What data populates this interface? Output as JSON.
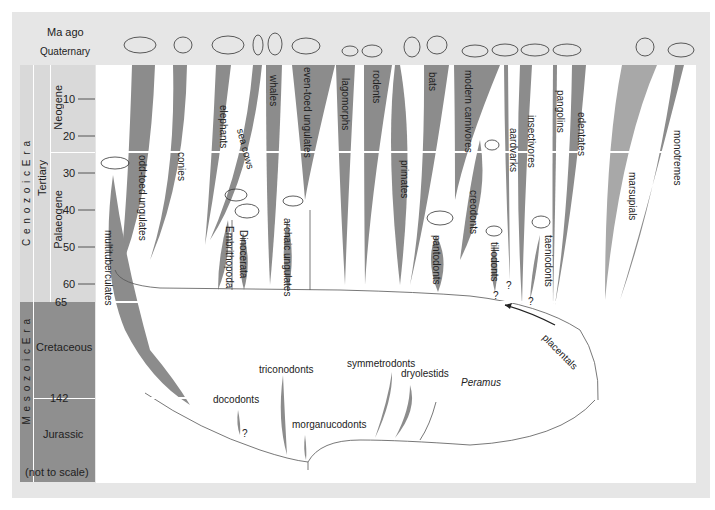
{
  "timescale": {
    "header": "Ma ago",
    "quaternary": "Quaternary",
    "eras": [
      {
        "name": "Cenozoic Era",
        "spaced": "C e n o z o i c   E r a"
      },
      {
        "name": "Mesozoic Era",
        "spaced": "M e s o z o i c   E r a"
      }
    ],
    "sub_eras": [
      "Tertiary"
    ],
    "periods": [
      "Neogene",
      "Palaeogene",
      "Cretaceous",
      "Jurassic"
    ],
    "ticks": [
      "10",
      "20",
      "30",
      "40",
      "50",
      "60",
      "65",
      "142"
    ],
    "note": "(not to scale)"
  },
  "lineages": {
    "cenozoic": [
      "odd-toed ungulates",
      "conies",
      "elephants",
      "sea cows",
      "whales",
      "even-toed ungulates",
      "lagomorphs",
      "rodents",
      "primates",
      "bats",
      "modern carnivores",
      "creodonts",
      "aardvarks",
      "insectivores",
      "pangolins",
      "edentates",
      "marsupials",
      "monotremes"
    ],
    "extinct_cenozoic": [
      "multituberculates",
      "Embrithopoda",
      "Dinocerata",
      "archaic ungulates",
      "pantodonts",
      "tillodonts",
      "taeniodonts"
    ],
    "mesozoic": [
      "triconodonts",
      "docodonts",
      "morganucodonts",
      "symmetrodonts",
      "dryolestids",
      "Peramus"
    ],
    "arrow_label": "placentals",
    "uncertain_mark": "?"
  },
  "colors": {
    "frame": "#e6e6e6",
    "timebar_mesozoic": "#8f8f8f",
    "timebar_cenozoic": "#d9d9d9",
    "lineage_fill": "#8c8c8c",
    "lineage_fill_light": "#a8a8a8",
    "line": "#444444"
  }
}
